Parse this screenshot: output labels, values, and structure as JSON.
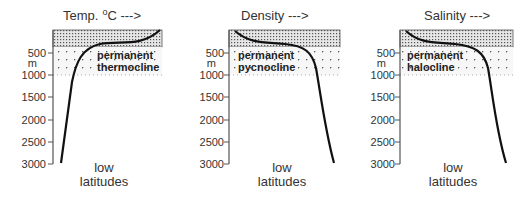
{
  "diagram": {
    "depth_unit": "m",
    "depth_ticks": [
      "500",
      "1000",
      "1500",
      "2000",
      "2500",
      "3000"
    ],
    "panels": [
      {
        "id": "temperature",
        "title": "Temp.",
        "title_unit_sup": "o",
        "title_unit": "C --->",
        "zone_label_line1": "permanent",
        "zone_label_line2": "thermocline",
        "footer_line1": "low",
        "footer_line2": "latitudes",
        "profile_direction": "decreasing with depth"
      },
      {
        "id": "density",
        "title": "Density --->",
        "zone_label_line1": "permanent",
        "zone_label_line2": "pycnocline",
        "footer_line1": "low",
        "footer_line2": "latitudes",
        "profile_direction": "increasing with depth"
      },
      {
        "id": "salinity",
        "title": "Salinity --->",
        "zone_label_line1": "permanent",
        "zone_label_line2": "halocline",
        "footer_line1": "low",
        "footer_line2": "latitudes",
        "profile_direction": "increasing with depth"
      }
    ],
    "colors": {
      "curve": "#111111",
      "axis": "#555555",
      "surface_band_fill": "#d8d8d8",
      "cline_band_fill": "#f2f2f2"
    }
  }
}
